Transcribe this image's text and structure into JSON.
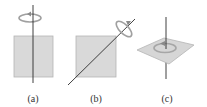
{
  "figure": {
    "panels": [
      {
        "label": "(a)",
        "description": "Square plate with rotation axis perpendicular through the center, vertical, in the plane of the plate",
        "axis_orientation": "vertical"
      },
      {
        "label": "(b)",
        "description": "Square plate with rotation axis along the diagonal",
        "axis_orientation": "diagonal"
      },
      {
        "label": "(c)",
        "description": "Square plate lying flat with rotation axis perpendicular to the plate through its center",
        "axis_orientation": "perpendicular"
      }
    ],
    "colors": {
      "plate_fill": "#d9d9d9",
      "plate_edge": "#b0b0b0",
      "axis": "#2a2a2a",
      "rotation_arrow": "#9a9a9a"
    }
  }
}
